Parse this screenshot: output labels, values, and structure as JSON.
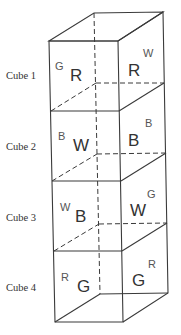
{
  "cubes": [
    {
      "label": "Cube 1",
      "front": "R",
      "left_hidden": "G",
      "right": "R",
      "back_hidden": "W"
    },
    {
      "label": "Cube 2",
      "front": "W",
      "left_hidden": "B",
      "right": "B",
      "back_hidden": "B"
    },
    {
      "label": "Cube 3",
      "front": "B",
      "left_hidden": "W",
      "right": "W",
      "back_hidden": "G"
    },
    {
      "label": "Cube 4",
      "front": "G",
      "left_hidden": "R",
      "right": "G",
      "back_hidden": "R"
    }
  ],
  "colors": {
    "line": "#3a3a3a",
    "background": "#ffffff"
  }
}
